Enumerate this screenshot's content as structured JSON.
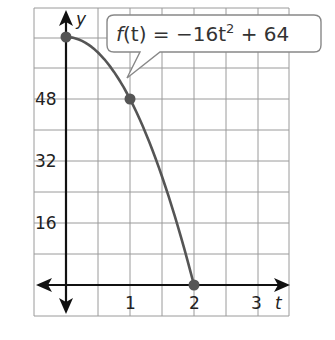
{
  "chart_data": {
    "type": "line",
    "title": "",
    "function_label": "f(t) = −16t² + 64",
    "xlabel": "t",
    "ylabel": "y",
    "xlim": [
      -0.5,
      3.5
    ],
    "ylim": [
      -8,
      72
    ],
    "x_ticks": [
      1,
      2,
      3
    ],
    "y_ticks": [
      16,
      32,
      48
    ],
    "grid": true,
    "grid_x_step": 0.5,
    "grid_y_step": 8,
    "series": [
      {
        "name": "f(t) = -16t^2 + 64",
        "x": [
          0,
          0.25,
          0.5,
          0.75,
          1,
          1.25,
          1.5,
          1.75,
          2
        ],
        "y": [
          64,
          63,
          60,
          55,
          48,
          39,
          28,
          15,
          0
        ]
      }
    ],
    "points": [
      {
        "x": 0,
        "y": 64
      },
      {
        "x": 1,
        "y": 48
      },
      {
        "x": 2,
        "y": 0
      }
    ]
  },
  "labels": {
    "y_axis": "y",
    "t_axis": "t",
    "x_tick_1": "1",
    "x_tick_2": "2",
    "x_tick_3": "3",
    "y_tick_16": "16",
    "y_tick_32": "32",
    "y_tick_48": "48",
    "callout_f": "f",
    "callout_rest": "(t) = −16t",
    "callout_exp": "2",
    "callout_tail": " + 64"
  }
}
